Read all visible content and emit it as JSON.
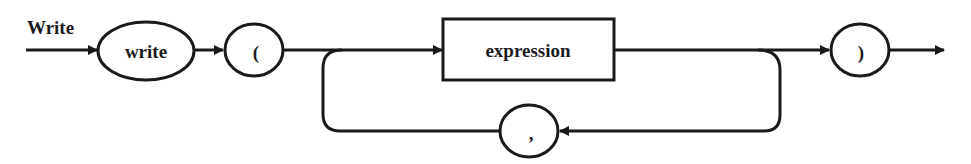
{
  "diagram": {
    "type": "syntax-diagram",
    "title": "Write",
    "nodes": [
      {
        "id": "write",
        "shape": "ellipse",
        "kind": "terminal",
        "label": "write"
      },
      {
        "id": "lparen",
        "shape": "circle",
        "kind": "terminal",
        "label": "("
      },
      {
        "id": "expression",
        "shape": "rectangle",
        "kind": "non-terminal",
        "label": "expression"
      },
      {
        "id": "comma",
        "shape": "circle",
        "kind": "terminal",
        "label": ","
      },
      {
        "id": "rparen",
        "shape": "circle",
        "kind": "terminal",
        "label": ")"
      }
    ],
    "edges": [
      {
        "from": "start",
        "to": "write"
      },
      {
        "from": "write",
        "to": "lparen"
      },
      {
        "from": "lparen",
        "to": "expression"
      },
      {
        "from": "expression",
        "to": "rparen"
      },
      {
        "from": "expression",
        "to": "comma",
        "note": "loop back"
      },
      {
        "from": "comma",
        "to": "expression",
        "note": "repeat"
      },
      {
        "from": "rparen",
        "to": "end"
      }
    ]
  }
}
